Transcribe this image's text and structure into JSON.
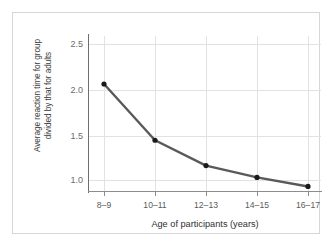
{
  "figure": {
    "border_color": "#d6d6d6",
    "background": "#ffffff"
  },
  "chart_data": {
    "type": "line",
    "title": "",
    "categories": [
      "8–9",
      "10–11",
      "12–13",
      "14–15",
      "16–17"
    ],
    "values": [
      2.18,
      1.56,
      1.28,
      1.15,
      1.05
    ],
    "xlabel": "Age of participants (years)",
    "ylabel_line1": "Average reaction time for group",
    "ylabel_line2": "divided by that for adults",
    "ylabel": "Average reaction time for group divided by that for adults",
    "ytick_labels": [
      "2.5",
      "2.0",
      "1.5",
      "1.0"
    ],
    "ytick_values": [
      2.5,
      2.0,
      1.5,
      1.0
    ],
    "ylim": [
      0.82,
      2.68
    ],
    "grid": true,
    "legend": "none",
    "line_color": "#595959",
    "marker_color": "#1a1a1a",
    "gridline_color": "#e2e2e2",
    "axis_color": "#6e6e6e"
  }
}
